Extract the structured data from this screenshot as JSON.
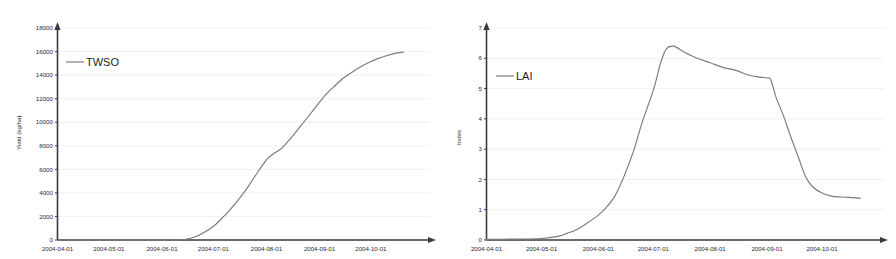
{
  "figure": {
    "panels": [
      "twso-panel",
      "lai-panel"
    ],
    "line_color": "#7a7a7a",
    "axis_color": "#3a3a3a",
    "grid_color": "#e9e9ef",
    "background": "#ffffff"
  },
  "chart_data": [
    {
      "type": "line",
      "panel_name": "twso-chart",
      "title": "",
      "xlabel": "",
      "ylabel": "Yield (kg/ha)",
      "grid": true,
      "legend_position": "top-left",
      "legend": [
        "TWSO"
      ],
      "ylim": [
        0,
        18000
      ],
      "yticks": [
        0,
        2000,
        4000,
        6000,
        8000,
        10000,
        12000,
        14000,
        16000,
        18000
      ],
      "ytick_labels": [
        "0",
        "2000",
        "4000",
        "6000",
        "8000",
        "10000",
        "12000",
        "14000",
        "16000",
        "18000"
      ],
      "xtick_labels": [
        "2004-04-01",
        "2004-05-01",
        "2004-06-01",
        "2004-07-01",
        "2004-08-01",
        "2004-09-01",
        "2004-10-01"
      ],
      "xlim": [
        "2004-04-01",
        "2004-10-25"
      ],
      "series": [
        {
          "name": "TWSO",
          "x": [
            "2004-04-01",
            "2004-04-15",
            "2004-05-01",
            "2004-05-15",
            "2004-06-01",
            "2004-06-10",
            "2004-06-15",
            "2004-06-20",
            "2004-06-25",
            "2004-07-01",
            "2004-07-05",
            "2004-07-10",
            "2004-07-15",
            "2004-07-20",
            "2004-07-25",
            "2004-08-01",
            "2004-08-05",
            "2004-08-10",
            "2004-08-15",
            "2004-08-20",
            "2004-08-25",
            "2004-09-01",
            "2004-09-05",
            "2004-09-10",
            "2004-09-15",
            "2004-09-20",
            "2004-09-25",
            "2004-10-01",
            "2004-10-05",
            "2004-10-10",
            "2004-10-15",
            "2004-10-20"
          ],
          "y": [
            0,
            0,
            0,
            0,
            0,
            0,
            60,
            250,
            600,
            1150,
            1700,
            2450,
            3300,
            4250,
            5350,
            6800,
            7300,
            7800,
            8600,
            9500,
            10400,
            11700,
            12400,
            13100,
            13750,
            14250,
            14700,
            15150,
            15400,
            15650,
            15850,
            15950
          ]
        }
      ]
    },
    {
      "type": "line",
      "panel_name": "lai-chart",
      "title": "",
      "xlabel": "",
      "ylabel": "Index",
      "grid": true,
      "legend_position": "top-left",
      "legend": [
        "LAI"
      ],
      "ylim": [
        0,
        7
      ],
      "yticks": [
        0,
        1,
        2,
        3,
        4,
        5,
        6,
        7
      ],
      "ytick_labels": [
        "0",
        "1",
        "2",
        "3",
        "4",
        "5",
        "6",
        "7"
      ],
      "xtick_labels": [
        "2004-04-01",
        "2004-05-01",
        "2004-06-01",
        "2004-07-01",
        "2004-08-01",
        "2004-09-01",
        "2004-10-01"
      ],
      "xlim": [
        "2004-04-01",
        "2004-10-25"
      ],
      "series": [
        {
          "name": "LAI",
          "x": [
            "2004-04-01",
            "2004-04-15",
            "2004-05-01",
            "2004-05-10",
            "2004-05-15",
            "2004-05-20",
            "2004-05-25",
            "2004-06-01",
            "2004-06-05",
            "2004-06-10",
            "2004-06-15",
            "2004-06-20",
            "2004-06-25",
            "2004-07-01",
            "2004-07-05",
            "2004-07-08",
            "2004-07-12",
            "2004-07-18",
            "2004-07-25",
            "2004-08-01",
            "2004-08-08",
            "2004-08-15",
            "2004-08-22",
            "2004-08-28",
            "2004-09-01",
            "2004-09-03",
            "2004-09-06",
            "2004-09-10",
            "2004-09-14",
            "2004-09-18",
            "2004-09-22",
            "2004-09-26",
            "2004-10-01",
            "2004-10-06",
            "2004-10-12",
            "2004-10-18",
            "2004-10-22"
          ],
          "y": [
            0.02,
            0.03,
            0.05,
            0.12,
            0.22,
            0.34,
            0.52,
            0.82,
            1.05,
            1.45,
            2.1,
            2.9,
            3.9,
            4.95,
            5.85,
            6.3,
            6.4,
            6.2,
            6.0,
            5.85,
            5.7,
            5.6,
            5.45,
            5.38,
            5.35,
            5.3,
            4.7,
            4.1,
            3.4,
            2.75,
            2.1,
            1.75,
            1.55,
            1.45,
            1.42,
            1.4,
            1.38
          ]
        }
      ]
    }
  ]
}
